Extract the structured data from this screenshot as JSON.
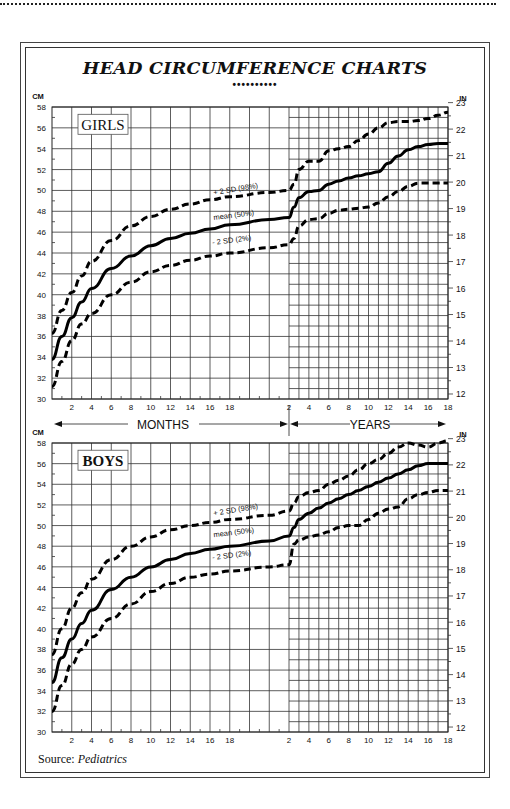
{
  "page": {
    "title": "HEAD CIRCUMFERENCE CHARTS",
    "title_ornament": "••••••••••",
    "source_label": "Source: ",
    "source_name": "Pediatrics"
  },
  "axis_labels": {
    "left_unit": "CM",
    "right_unit": "IN",
    "months_label": "MONTHS",
    "years_label": "YEARS"
  },
  "chart_data": [
    {
      "type": "line",
      "title": "GIRLS",
      "xlabel": "MONTHS / YEARS",
      "ylabel": "CM",
      "ylabel_right": "IN",
      "ylim": [
        30,
        58
      ],
      "ylim_right": [
        12,
        23
      ],
      "y_ticks_cm": [
        30,
        32,
        34,
        36,
        38,
        40,
        42,
        44,
        46,
        48,
        50,
        52,
        54,
        56,
        58
      ],
      "y_ticks_in": [
        12,
        13,
        14,
        15,
        16,
        17,
        18,
        19,
        20,
        21,
        22,
        23
      ],
      "x_ticks_months": [
        2,
        4,
        6,
        8,
        10,
        12,
        14,
        16,
        18
      ],
      "x_ticks_years": [
        2,
        4,
        6,
        8,
        10,
        12,
        14,
        16,
        18
      ],
      "grid": true,
      "series": [
        {
          "name": "+ 2 SD (98%)",
          "style": "dashed",
          "months": [
            0,
            1,
            2,
            3,
            4,
            6,
            8,
            10,
            12,
            14,
            16,
            18,
            22,
            24
          ],
          "months_values": [
            36.3,
            38.5,
            40.2,
            41.8,
            43.2,
            45.2,
            46.6,
            47.5,
            48.2,
            48.7,
            49.1,
            49.4,
            49.8,
            50.0
          ],
          "years": [
            2,
            2.5,
            3,
            4,
            5,
            6,
            7,
            8,
            9,
            10,
            11,
            12,
            13,
            14,
            15,
            16,
            17,
            18
          ],
          "years_values": [
            50.0,
            50.6,
            52.0,
            52.8,
            52.8,
            53.8,
            54.0,
            54.2,
            54.8,
            55.4,
            56.0,
            56.5,
            56.6,
            56.6,
            56.7,
            56.9,
            57.2,
            57.5
          ]
        },
        {
          "name": "mean (50%)",
          "style": "solid",
          "months": [
            0,
            1,
            2,
            3,
            4,
            6,
            8,
            10,
            12,
            14,
            16,
            18,
            22,
            24
          ],
          "months_values": [
            33.8,
            36.0,
            37.8,
            39.3,
            40.6,
            42.5,
            43.7,
            44.7,
            45.4,
            45.9,
            46.3,
            46.7,
            47.2,
            47.4
          ],
          "years": [
            2,
            2.5,
            3,
            4,
            5,
            6,
            7,
            8,
            9,
            10,
            11,
            12,
            13,
            14,
            15,
            16,
            17,
            18
          ],
          "years_values": [
            47.4,
            48.4,
            49.3,
            49.9,
            50.0,
            50.6,
            50.9,
            51.2,
            51.4,
            51.6,
            51.8,
            52.6,
            53.3,
            53.9,
            54.2,
            54.4,
            54.5,
            54.5
          ]
        },
        {
          "name": "- 2 SD (2%)",
          "style": "dashed",
          "months": [
            0,
            1,
            2,
            3,
            4,
            6,
            8,
            10,
            12,
            14,
            16,
            18,
            22,
            24
          ],
          "months_values": [
            31.2,
            33.6,
            35.6,
            37.2,
            38.2,
            40.0,
            41.2,
            42.2,
            42.8,
            43.3,
            43.7,
            44.0,
            44.5,
            44.8
          ],
          "years": [
            2,
            2.5,
            3,
            4,
            5,
            6,
            7,
            8,
            9,
            10,
            11,
            12,
            13,
            14,
            15,
            16,
            17,
            18
          ],
          "years_values": [
            44.8,
            45.4,
            46.6,
            47.2,
            47.3,
            47.8,
            48.1,
            48.2,
            48.3,
            48.4,
            48.8,
            49.4,
            49.9,
            50.4,
            50.7,
            50.7,
            50.7,
            50.7
          ]
        }
      ]
    },
    {
      "type": "line",
      "title": "BOYS",
      "xlabel": "MONTHS / YEARS",
      "ylabel": "CM",
      "ylabel_right": "IN",
      "ylim": [
        30,
        58
      ],
      "ylim_right": [
        12,
        23
      ],
      "y_ticks_cm": [
        30,
        32,
        34,
        36,
        38,
        40,
        42,
        44,
        46,
        48,
        50,
        52,
        54,
        56,
        58
      ],
      "y_ticks_in": [
        12,
        13,
        14,
        15,
        16,
        17,
        18,
        19,
        20,
        21,
        22,
        23
      ],
      "x_ticks_months": [
        2,
        4,
        6,
        8,
        10,
        12,
        14,
        16,
        18
      ],
      "x_ticks_years": [
        2,
        4,
        6,
        8,
        10,
        12,
        14,
        16,
        18
      ],
      "grid": true,
      "series": [
        {
          "name": "+ 2 SD (98%)",
          "style": "dashed",
          "months": [
            0,
            1,
            2,
            3,
            4,
            6,
            8,
            10,
            12,
            14,
            16,
            18,
            22,
            24
          ],
          "months_values": [
            37.5,
            40.0,
            42.0,
            43.5,
            44.8,
            46.7,
            48.0,
            48.9,
            49.6,
            50.0,
            50.3,
            50.6,
            51.0,
            51.4
          ],
          "years": [
            2,
            2.5,
            3,
            4,
            5,
            6,
            7,
            8,
            9,
            10,
            11,
            12,
            13,
            14,
            15,
            16,
            17,
            18
          ],
          "years_values": [
            51.4,
            52.2,
            52.8,
            53.2,
            53.4,
            54.0,
            54.4,
            54.8,
            55.4,
            56.0,
            56.4,
            57.0,
            57.6,
            58.0,
            57.8,
            57.6,
            58.0,
            58.2
          ]
        },
        {
          "name": "mean (50%)",
          "style": "solid",
          "months": [
            0,
            1,
            2,
            3,
            4,
            6,
            8,
            10,
            12,
            14,
            16,
            18,
            22,
            24
          ],
          "months_values": [
            34.8,
            37.2,
            39.0,
            40.5,
            41.8,
            43.8,
            45.0,
            46.0,
            46.7,
            47.3,
            47.7,
            48.0,
            48.5,
            49.0
          ],
          "years": [
            2,
            2.5,
            3,
            4,
            5,
            6,
            7,
            8,
            9,
            10,
            11,
            12,
            13,
            14,
            15,
            16,
            17,
            18
          ],
          "years_values": [
            49.0,
            49.8,
            50.6,
            51.2,
            51.7,
            52.2,
            52.6,
            53.0,
            53.4,
            53.8,
            54.2,
            54.6,
            55.0,
            55.4,
            55.8,
            56.0,
            56.0,
            56.0
          ]
        },
        {
          "name": "- 2 SD (2%)",
          "style": "dashed",
          "months": [
            0,
            1,
            2,
            3,
            4,
            6,
            8,
            10,
            12,
            14,
            16,
            18,
            22,
            24
          ],
          "months_values": [
            32.0,
            34.5,
            36.6,
            38.0,
            39.2,
            41.0,
            42.4,
            43.6,
            44.4,
            45.0,
            45.3,
            45.6,
            46.0,
            46.2
          ],
          "years": [
            2,
            2.5,
            3,
            4,
            5,
            6,
            7,
            8,
            9,
            10,
            11,
            12,
            13,
            14,
            15,
            16,
            17,
            18
          ],
          "years_values": [
            46.2,
            48.2,
            48.6,
            48.9,
            49.1,
            49.4,
            49.8,
            50.0,
            50.0,
            50.6,
            51.2,
            51.6,
            51.8,
            52.6,
            53.0,
            53.2,
            53.4,
            53.4
          ]
        }
      ]
    }
  ]
}
